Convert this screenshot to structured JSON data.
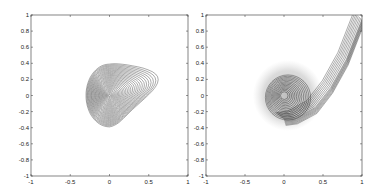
{
  "chart_data": [
    {
      "type": "contour",
      "title": "",
      "xlabel": "",
      "ylabel": "",
      "xlim": [
        -1,
        1
      ],
      "ylim": [
        -1,
        1
      ],
      "xticks": [
        -1,
        -0.5,
        0,
        0.5,
        1
      ],
      "xtick_labels": [
        "-1",
        "-0.5",
        "0",
        "0.5",
        "1"
      ],
      "yticks": [
        -1,
        -0.8,
        -0.6,
        -0.4,
        -0.2,
        0,
        0.2,
        0.4,
        0.6,
        0.8,
        1
      ],
      "ytick_labels": [
        "-1",
        "-0.8",
        "-0.6",
        "-0.4",
        "-0.2",
        "0",
        "0.2",
        "0.4",
        "0.6",
        "0.8",
        "1"
      ],
      "grid": false,
      "description": "Dense concentric contour lines forming a teardrop shape centered at (0,0); spans x from about -0.27 to 0.65, y from about -0.38 to 0.40, with a tip pointing right toward (0.65, 0.22).",
      "center": [
        0,
        0
      ],
      "extent": {
        "xmin": -0.27,
        "xmax": 0.65,
        "ymin": -0.38,
        "ymax": 0.4
      },
      "tip": [
        0.65,
        0.22
      ],
      "line_color": "#222222"
    },
    {
      "type": "contour",
      "title": "",
      "xlabel": "",
      "ylabel": "",
      "xlim": [
        -1,
        1
      ],
      "ylim": [
        -1,
        1
      ],
      "xticks": [
        -1,
        -0.5,
        0,
        0.5,
        1
      ],
      "xtick_labels": [
        "-1",
        "-0.5",
        "0",
        "0.5",
        "1"
      ],
      "yticks": [
        -1,
        -0.8,
        -0.6,
        -0.4,
        -0.2,
        0,
        0.2,
        0.4,
        0.6,
        0.8,
        1
      ],
      "ytick_labels": [
        "-1",
        "-0.8",
        "-0.6",
        "-0.4",
        "-0.2",
        "0",
        "0.2",
        "0.4",
        "0.6",
        "0.8",
        "1"
      ],
      "grid": false,
      "description": "Concentric contours centered at (0,0) surrounded by a diffuse gray cloud (x -0.35 to 0.5, y -0.4 to 0.4); dense contour bands sweep from about (0.2,-0.28) up and to the right in a curved ridge to (1, 0.95).",
      "center": [
        0,
        0
      ],
      "cloud_extent": {
        "xmin": -0.35,
        "xmax": 0.5,
        "ymin": -0.4,
        "ymax": 0.42
      },
      "ridge": [
        [
          0.15,
          -0.28
        ],
        [
          0.4,
          -0.15
        ],
        [
          0.6,
          0.1
        ],
        [
          0.8,
          0.45
        ],
        [
          1.0,
          0.95
        ]
      ],
      "line_color": "#222222"
    }
  ]
}
